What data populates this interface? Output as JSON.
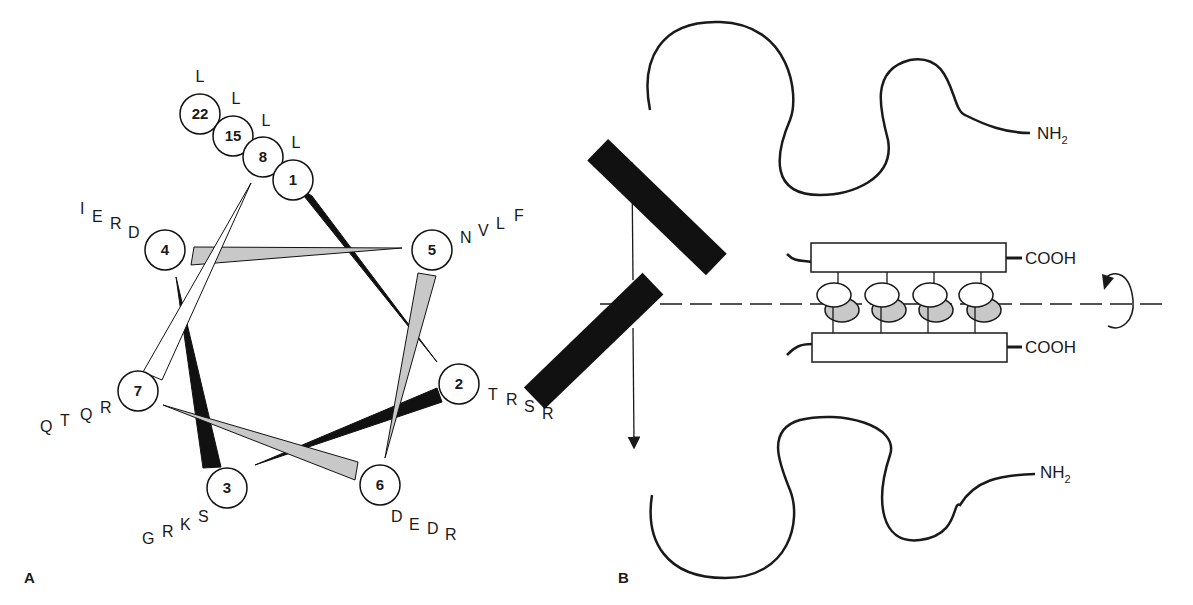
{
  "figure": {
    "panel_a": {
      "label": "A",
      "title": "Helical wheel projection",
      "positions": [
        {
          "number": "1",
          "residues": [
            "L"
          ]
        },
        {
          "number": "2",
          "residues": [
            "T",
            "R",
            "S",
            "R"
          ]
        },
        {
          "number": "3",
          "residues": [
            "G",
            "R",
            "K",
            "S"
          ]
        },
        {
          "number": "4",
          "residues": [
            "I",
            "E",
            "R",
            "D"
          ]
        },
        {
          "number": "5",
          "residues": [
            "N",
            "V",
            "L",
            "F"
          ]
        },
        {
          "number": "6",
          "residues": [
            "D",
            "E",
            "D",
            "R"
          ]
        },
        {
          "number": "7",
          "residues": [
            "Q",
            "T",
            "Q",
            "R"
          ]
        },
        {
          "number": "8",
          "residues": [
            "L"
          ]
        },
        {
          "number": "15",
          "residues": [
            "L"
          ]
        },
        {
          "number": "22",
          "residues": [
            "L"
          ]
        }
      ],
      "colors": {
        "dark_wedge": "#111111",
        "gray_wedge": "#c8c8c8",
        "white_wedge": "#ffffff"
      }
    },
    "panel_b": {
      "label": "B",
      "title": "Leucine zipper dimer",
      "top_chain": {
        "n_terminus": "NH2",
        "c_terminus": "COOH"
      },
      "bottom_chain": {
        "n_terminus": "NH2",
        "c_terminus": "COOH"
      },
      "colors": {
        "dna_binding_bar": "#111111",
        "interface_gray": "#c8c8c8"
      }
    }
  }
}
